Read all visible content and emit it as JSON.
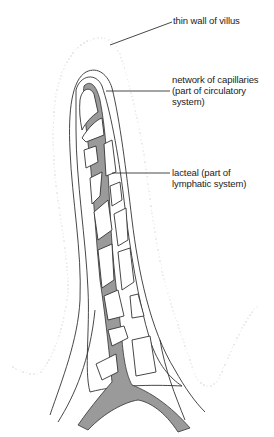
{
  "figure": {
    "labels": [
      {
        "id": "wall",
        "text": "thin wall of villus",
        "x": 173,
        "y": 15
      },
      {
        "id": "capillaries",
        "text": "network of capillaries\n(part of circulatory\nsystem)",
        "x": 172,
        "y": 74
      },
      {
        "id": "lacteal",
        "text": "lacteal (part of\nlymphatic system)",
        "x": 172,
        "y": 170
      }
    ],
    "colors": {
      "lacteal_fill": "#9a9a9a",
      "outline": "#333333",
      "wall": "#555555",
      "background": "#ffffff"
    }
  }
}
